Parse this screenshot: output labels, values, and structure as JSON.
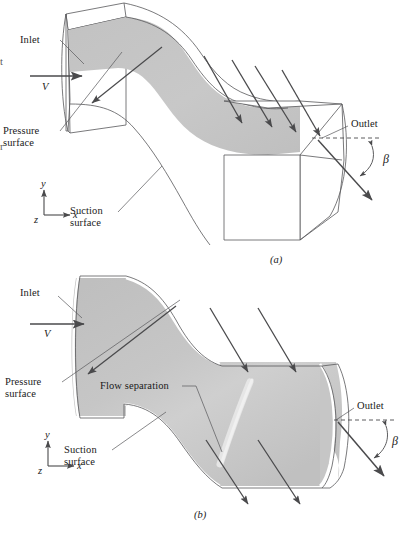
{
  "figure": {
    "colors": {
      "flow_fill": "#c4c4c4",
      "flow_fill_light": "#d4d4d4",
      "outline": "#58585a",
      "arrow": "#4a4a4c",
      "text": "#1a1a1a",
      "background": "#ffffff"
    }
  },
  "panel_a": {
    "caption": "(a)",
    "labels": {
      "inlet": "Inlet",
      "velocity": "V",
      "pressure_surface_line1": "Pressure",
      "pressure_surface_line2": "surface",
      "suction_surface_line1": "Suction",
      "suction_surface_line2": "surface",
      "outlet": "Outlet",
      "beta": "β"
    },
    "axes": {
      "y": "y",
      "x": "x",
      "z": "z"
    },
    "clipped_left": {
      "upper": "t",
      "lower": "r"
    }
  },
  "panel_b": {
    "caption": "(b)",
    "labels": {
      "inlet": "Inlet",
      "velocity": "V",
      "pressure_surface_line1": "Pressure",
      "pressure_surface_line2": "surface",
      "suction_surface_line1": "Suction",
      "suction_surface_line2": "surface",
      "flow_separation": "Flow separation",
      "outlet": "Outlet",
      "beta": "β"
    },
    "axes": {
      "y": "y",
      "x": "x",
      "z": "z"
    }
  }
}
